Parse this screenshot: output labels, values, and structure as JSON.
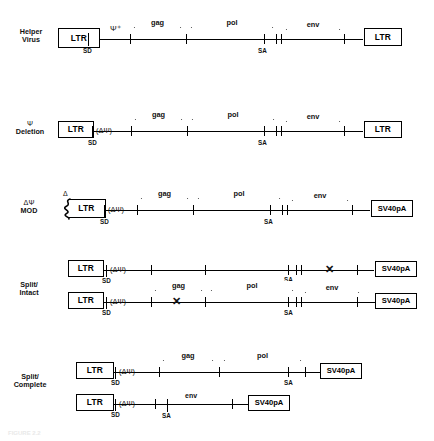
{
  "figure": {
    "type": "retroviral-vector-construct-diagram",
    "caption": "FIGURE 2.2"
  },
  "glyphs": {
    "psi": "Ψ",
    "delta": "Δ",
    "psi_plus": "Ψ⁺",
    "delta_psi_paren": "(ΔΨ)",
    "x_cross": "✕",
    "sd": "SD",
    "sa": "SA"
  },
  "labels": {
    "ltr": "LTR",
    "sv40pa": "SV40pA",
    "gag": "gag",
    "pol": "pol",
    "env": "env"
  },
  "rows": [
    {
      "id": "helper-virus",
      "name": "Helper Virus",
      "caption_line1": "Helper",
      "caption_line2": "Virus",
      "constructs": [
        {
          "left_box": "LTR",
          "right_box": "LTR",
          "psi": "Ψ⁺",
          "sd": "SD",
          "sa": "SA",
          "genes": [
            "gag",
            "pol",
            "env"
          ],
          "cross": null
        }
      ]
    },
    {
      "id": "psi-deletion",
      "name": "Ψ Deletion",
      "caption_line1": "Ψ",
      "caption_line2": "Deletion",
      "constructs": [
        {
          "left_box": "LTR",
          "right_box": "LTR",
          "psi": "(ΔΨ)",
          "sd": "SD",
          "sa": "SA",
          "genes": [
            "gag",
            "pol",
            "env"
          ],
          "cross": null
        }
      ]
    },
    {
      "id": "delta-psi-mod",
      "name": "ΔΨ MOD",
      "caption_line1": "ΔΨ",
      "caption_line2": "MOD",
      "constructs": [
        {
          "left_box": "LTR",
          "left_box_delta": "Δ",
          "right_box": "SV40pA",
          "psi": "(ΔΨ)",
          "sd": "SD",
          "sa": "SA",
          "genes": [
            "gag",
            "pol",
            "env"
          ],
          "cross": null
        }
      ]
    },
    {
      "id": "split-intact",
      "name": "Split/Intact",
      "caption_line1": "Split/",
      "caption_line2": "Intact",
      "constructs": [
        {
          "left_box": "LTR",
          "right_box": "SV40pA",
          "psi": "(ΔΨ)",
          "sa": "SA",
          "sd": "SD",
          "genes": [],
          "cross": "✕",
          "cross_region": "env"
        },
        {
          "left_box": "LTR",
          "right_box": "SV40pA",
          "psi": "(ΔΨ)",
          "sd": "SD",
          "sa": "SA",
          "genes": [
            "gag",
            "pol",
            "env"
          ],
          "cross": "✕",
          "cross_region": "gag"
        }
      ]
    },
    {
      "id": "split-complete",
      "name": "Split/Complete",
      "caption_line1": "Split/",
      "caption_line2": "Complete",
      "constructs": [
        {
          "left_box": "LTR",
          "right_box": "SV40pA",
          "psi": "(ΔΨ)",
          "sd": "SD",
          "sa": "SA",
          "genes": [
            "gag",
            "pol"
          ],
          "cross": null
        },
        {
          "left_box": "LTR",
          "right_box": "SV40pA",
          "psi": "(ΔΨ)",
          "sd": "SD",
          "sa": "SA",
          "genes": [
            "env"
          ],
          "cross": null
        }
      ]
    }
  ]
}
